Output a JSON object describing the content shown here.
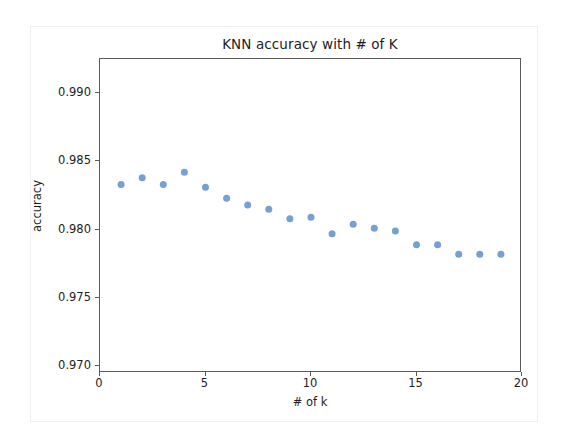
{
  "chart_data": {
    "type": "scatter",
    "title": "KNN accuracy with # of K",
    "xlabel": "# of k",
    "ylabel": "accuracy",
    "xlim": [
      0,
      20
    ],
    "ylim": [
      0.9695,
      0.9925
    ],
    "grid": false,
    "legend": null,
    "marker_color": "#6f9bd1",
    "marker_size": 7,
    "xticks": [
      0,
      5,
      10,
      15,
      20
    ],
    "xtick_labels": [
      "0",
      "5",
      "10",
      "15",
      "20"
    ],
    "yticks": [
      0.97,
      0.975,
      0.98,
      0.985,
      0.99
    ],
    "ytick_labels": [
      "0.970",
      "0.975",
      "0.980",
      "0.985",
      "0.990"
    ],
    "x": [
      1,
      2,
      3,
      4,
      5,
      6,
      7,
      8,
      9,
      10,
      11,
      12,
      13,
      14,
      15,
      16,
      17,
      18,
      19
    ],
    "values": [
      0.9833,
      0.9838,
      0.9833,
      0.9842,
      0.9831,
      0.9823,
      0.9818,
      0.9815,
      0.9808,
      0.9809,
      0.9797,
      0.9804,
      0.9801,
      0.9799,
      0.9789,
      0.9789,
      0.9782,
      0.9782,
      0.9782
    ],
    "series": [
      {
        "name": "accuracy",
        "values": [
          0.9833,
          0.9838,
          0.9833,
          0.9842,
          0.9831,
          0.9823,
          0.9818,
          0.9815,
          0.9808,
          0.9809,
          0.9797,
          0.9804,
          0.9801,
          0.9799,
          0.9789,
          0.9789,
          0.9782,
          0.9782,
          0.9782
        ]
      }
    ]
  },
  "figure": {
    "background": "#ffffff",
    "axes_edge_color": "#5a5a5a",
    "text_color": "#1d1d1d"
  }
}
